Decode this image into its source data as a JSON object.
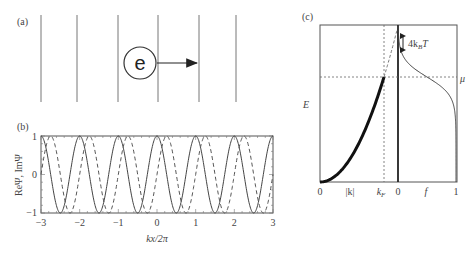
{
  "panels": {
    "a": {
      "label": "(a)",
      "electron_label": "e",
      "wavefront_count": 6
    },
    "b": {
      "label": "(b)",
      "ylabel": "ReΨ, ImΨ",
      "xlabel": "kx/2π",
      "xticks": [
        "−3",
        "−2",
        "−1",
        "0",
        "1",
        "2",
        "3"
      ],
      "yticks": [
        "1",
        "0",
        "−1"
      ]
    },
    "c": {
      "label": "(c)",
      "ylabel": "E",
      "mu_label": "μ",
      "thermal_label_prefix": "4k",
      "thermal_label_sub": "B",
      "thermal_label_suffix": "T",
      "left_xticks": {
        "zero": "0",
        "k": "|k|",
        "kf": "k",
        "kf_sub": "F"
      },
      "right_xticks": {
        "zero": "0",
        "f": "f",
        "one": "1"
      }
    }
  },
  "chart_data": [
    {
      "type": "line",
      "title": "(b)",
      "xlabel": "kx/2π",
      "ylabel": "ReΨ, ImΨ",
      "xlim": [
        -3,
        3
      ],
      "ylim": [
        -1,
        1
      ],
      "xticks": [
        -3,
        -2,
        -1,
        0,
        1,
        2,
        3
      ],
      "yticks": [
        -1,
        0,
        1
      ],
      "series": [
        {
          "name": "ReΨ",
          "style": "solid",
          "function": "cos(2π·x)"
        },
        {
          "name": "ImΨ",
          "style": "dashed",
          "function": "sin(2π·x)"
        }
      ]
    },
    {
      "type": "line",
      "title": "(c)",
      "ylabel": "E",
      "left_panel": {
        "xlabel": "|k|",
        "xticks": [
          "0",
          "|k|",
          "k_F"
        ],
        "curve": "E ∝ k² (thick, occupied up to k_F; dashed above)"
      },
      "right_panel": {
        "xlabel": "f",
        "xticks": [
          "0",
          "f",
          "1"
        ],
        "curve": "Fermi–Dirac distribution, step at μ, width ≈ 4k_BT"
      },
      "annotations": [
        "μ",
        "4k_BT",
        "k_F"
      ]
    }
  ]
}
